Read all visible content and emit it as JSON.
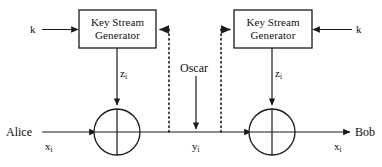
{
  "diagram": {
    "colors": {
      "stroke": "#1a1a1a",
      "text": "#0f0f0f",
      "background": "#ffffff"
    },
    "blocks": [
      {
        "id": "key-stream-generator-alice",
        "line1": "Key Stream",
        "line2": "Generator"
      },
      {
        "id": "key-stream-generator-bob",
        "line1": "Key Stream",
        "line2": "Generator"
      }
    ],
    "labels": {
      "key_left": "k",
      "key_right": "k",
      "alice": "Alice",
      "bob": "Bob",
      "oscar": "Oscar",
      "plaintext_left_base": "x",
      "plaintext_left_sub": "i",
      "plaintext_right_base": "x",
      "plaintext_right_sub": "i",
      "ciphertext_base": "y",
      "ciphertext_sub": "i",
      "keystream_left_base": "z",
      "keystream_left_sub": "i",
      "keystream_right_base": "z",
      "keystream_right_sub": "i"
    },
    "operators": [
      {
        "id": "xor-alice",
        "symbol": "xor-circle"
      },
      {
        "id": "xor-bob",
        "symbol": "xor-circle"
      }
    ],
    "channel": {
      "type": "insecure-channel",
      "tap_lines": 2,
      "tap_style": "dotted"
    }
  }
}
